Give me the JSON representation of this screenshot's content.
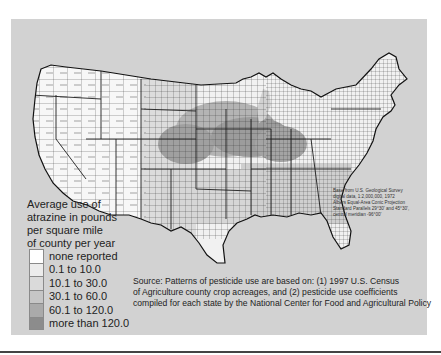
{
  "map": {
    "subject": "Atrazine use by county, conterminous United States",
    "colors": {
      "panel_background": "#d2d2d2",
      "none_reported": "#ffffff",
      "class_1": "#ececec",
      "class_2": "#d8d8d8",
      "class_3": "#c4c4c4",
      "class_4": "#a8a8a8",
      "class_5": "#8a8a8a",
      "boundary": "#222222"
    }
  },
  "legend": {
    "title_lines": [
      "Average use of",
      "atrazine in pounds",
      "per square mile",
      "of county per year"
    ],
    "items": [
      {
        "label": "none reported",
        "color": "#ffffff"
      },
      {
        "label": "0.1 to 10.0",
        "color": "#ececec"
      },
      {
        "label": "10.1 to 30.0",
        "color": "#dadada"
      },
      {
        "label": "30.1 to 60.0",
        "color": "#c6c6c6"
      },
      {
        "label": "60.1 to 120.0",
        "color": "#aaaaaa"
      },
      {
        "label": "more than 120.0",
        "color": "#8c8c8c"
      }
    ]
  },
  "base_note": {
    "lines": [
      "Base from U.S. Geological Survey",
      "digital data, 1:2,000,000, 1972",
      "Albers Equal-Area Conic Projection",
      "Standard Parallels 29°30' and 45°30',",
      "central meridian  -96°00'"
    ]
  },
  "source": {
    "lines": [
      "Source: Patterns of pesticide use are based on: (1) 1997 U.S. Census",
      "of Agriculture county crop acreages, and (2) pesticide use coefficients",
      "compiled for each state by the National Center for Food and Agricultural Policy"
    ]
  }
}
